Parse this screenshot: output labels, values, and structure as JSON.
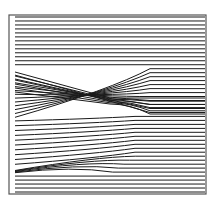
{
  "figure": {
    "type": "ray-trajectory diagram",
    "frame": {
      "x": 9,
      "y": 15,
      "width": 197,
      "height": 179,
      "stroke": "#555555"
    },
    "line_color": "#1a1a1a",
    "line_start_x": 15,
    "line_end_x": 205,
    "num_lines": 45,
    "right_y_start": 17,
    "right_y_end": 192,
    "regions": {
      "top_horizontal": {
        "y_from": 17,
        "y_to": 68
      },
      "crossing_bundle": {
        "left_y_from": 72,
        "left_y_to": 118,
        "focus": {
          "x": 110,
          "y": 97
        },
        "description": "rays crossing and converging to a caustic point"
      },
      "middle_fan": {
        "left_y_from": 120,
        "left_y_to": 165
      },
      "lower_caustic": {
        "origin": {
          "x": 15,
          "y": 172
        },
        "tip": {
          "x": 100,
          "y": 155
        },
        "description": "dense rays along a rising caustic line"
      },
      "bottom_horizontal": {
        "y_from": 174,
        "y_to": 192
      }
    }
  }
}
